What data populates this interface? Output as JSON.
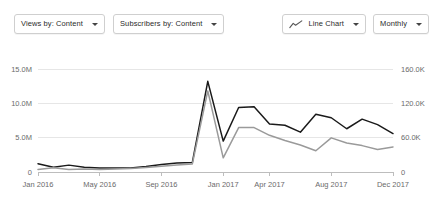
{
  "toolbar": {
    "views_by": {
      "label": "Views by: Content",
      "caret_icon": "chevron-down-icon"
    },
    "subscribers_by": {
      "label": "Subscribers by: Content",
      "caret_icon": "chevron-down-icon"
    },
    "chart_type": {
      "label": "Line Chart",
      "icon": "line-chart-icon",
      "caret_icon": "chevron-down-icon"
    },
    "interval": {
      "label": "Monthly",
      "caret_icon": "chevron-down-icon"
    }
  },
  "colors": {
    "views_line": "#1a1a1a",
    "subscribers_line": "#9a9a9a",
    "gridline": "#e6e6e6",
    "axis_text": "#6b6b6b",
    "control_border": "#cfcfcf"
  },
  "chart_data": {
    "type": "line",
    "title": "",
    "xlabel": "",
    "ylabel": "",
    "grid": true,
    "legend": "none",
    "x": [
      "Jan 2016",
      "Feb 2016",
      "Mar 2016",
      "Apr 2016",
      "May 2016",
      "Jun 2016",
      "Jul 2016",
      "Aug 2016",
      "Sep 2016",
      "Oct 2016",
      "Nov 2016",
      "Dec 2016",
      "Jan 2017",
      "Feb 2017",
      "Mar 2017",
      "Apr 2017",
      "May 2017",
      "Jun 2017",
      "Jul 2017",
      "Aug 2017",
      "Sep 2017",
      "Oct 2017",
      "Nov 2017",
      "Dec 2017"
    ],
    "xtick_labels": [
      "Jan 2016",
      "May 2016",
      "Sep 2016",
      "Jan 2017",
      "Apr 2017",
      "Aug 2017",
      "Dec 2017"
    ],
    "xtick_indices": [
      0,
      4,
      8,
      12,
      15,
      19,
      23
    ],
    "left_axis": {
      "ticks": [
        0,
        5000000,
        10000000,
        15000000
      ],
      "tick_labels": [
        "0",
        "5.0M",
        "10.0M",
        "15.0M"
      ],
      "ylim": [
        0,
        15000000
      ]
    },
    "right_axis": {
      "ticks": [
        0,
        60000,
        120000,
        160000
      ],
      "tick_labels": [
        "0",
        "60.0K",
        "120.0K",
        "160.0K"
      ],
      "ylim": [
        0,
        160000
      ]
    },
    "series": [
      {
        "name": "Views",
        "axis": "left",
        "color": "#1a1a1a",
        "values": [
          1200000,
          700000,
          1000000,
          700000,
          600000,
          600000,
          600000,
          800000,
          1100000,
          1300000,
          1400000,
          13200000,
          4500000,
          9400000,
          9500000,
          7000000,
          6800000,
          5800000,
          8400000,
          7900000,
          6300000,
          7700000,
          6900000,
          5600000
        ]
      },
      {
        "name": "Subscribers",
        "axis": "right",
        "color": "#9a9a9a",
        "values": [
          4000,
          6500,
          4000,
          4500,
          4000,
          4500,
          5500,
          7000,
          9000,
          11000,
          12500,
          126000,
          22000,
          69000,
          69000,
          57000,
          49000,
          42000,
          33000,
          53000,
          45000,
          41000,
          35000,
          39000
        ]
      }
    ]
  }
}
